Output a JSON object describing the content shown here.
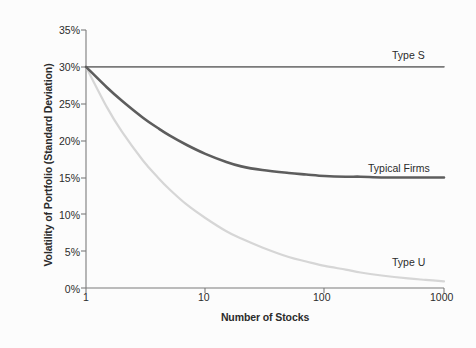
{
  "chart_data": {
    "type": "line",
    "title": "",
    "xlabel": "Number of Stocks",
    "ylabel": "Volatility of Portfolio (Standard Deviation)",
    "xscale": "log",
    "xlim": [
      1,
      1000
    ],
    "ylim": [
      0,
      35
    ],
    "xticks": [
      1,
      10,
      100,
      1000
    ],
    "xticklabels": [
      "1",
      "10",
      "100",
      "1000"
    ],
    "yticks": [
      0,
      5,
      10,
      15,
      20,
      25,
      30,
      35
    ],
    "yticklabels": [
      "0%",
      "5%",
      "10%",
      "15%",
      "20%",
      "25%",
      "30%",
      "35%"
    ],
    "grid": false,
    "legend_position": "inline-right-of-curves",
    "series": [
      {
        "name": "Type S",
        "label": "Type S",
        "color": "#7a7a7a",
        "width": 1.6,
        "x": [
          1,
          2,
          3,
          5,
          10,
          20,
          50,
          100,
          200,
          500,
          1000
        ],
        "values": [
          30.0,
          30.0,
          30.0,
          30.0,
          30.0,
          30.0,
          30.0,
          30.0,
          30.0,
          30.0,
          30.0
        ]
      },
      {
        "name": "Typical Firms",
        "label": "Typical Firms",
        "color": "#5d5d5d",
        "width": 2.6,
        "x": [
          1,
          1.5,
          2,
          3,
          4,
          5,
          7,
          10,
          15,
          20,
          30,
          50,
          70,
          100,
          150,
          200,
          300,
          500,
          700,
          1000
        ],
        "values": [
          30.0,
          27.2,
          25.4,
          23.1,
          21.7,
          20.7,
          19.4,
          18.2,
          17.1,
          16.5,
          16.0,
          15.6,
          15.4,
          15.2,
          15.1,
          15.1,
          15.0,
          15.0,
          15.0,
          15.0
        ]
      },
      {
        "name": "Type U",
        "label": "Type U",
        "color": "#d6d6d6",
        "width": 2.2,
        "x": [
          1,
          1.5,
          2,
          3,
          4,
          5,
          7,
          10,
          15,
          20,
          30,
          50,
          70,
          100,
          150,
          200,
          300,
          500,
          700,
          1000
        ],
        "values": [
          30.0,
          24.5,
          21.2,
          17.3,
          15.0,
          13.4,
          11.3,
          9.5,
          7.7,
          6.7,
          5.5,
          4.2,
          3.6,
          3.0,
          2.5,
          2.1,
          1.7,
          1.3,
          1.1,
          0.9
        ]
      }
    ],
    "annotations": [
      {
        "text": "Type S",
        "x": 520,
        "y": 31.2
      },
      {
        "text": "Typical Firms",
        "x": 420,
        "y": 16.6
      },
      {
        "text": "Type U",
        "x": 480,
        "y": 2.9
      }
    ]
  }
}
